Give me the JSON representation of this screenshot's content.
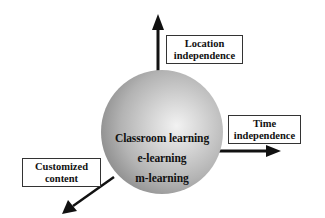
{
  "diagram": {
    "center": {
      "labels": [
        "Classroom learning",
        "e-learning",
        "m-learning"
      ],
      "shape": "sphere",
      "fill_gradient": [
        "#f2f2f2",
        "#b3b3b3",
        "#6e6e6e"
      ]
    },
    "axes": [
      {
        "direction": "up",
        "label_line1": "Location",
        "label_line2": "independence"
      },
      {
        "direction": "right",
        "label_line1": "Time",
        "label_line2": "independence"
      },
      {
        "direction": "down-left",
        "label_line1": "Customized",
        "label_line2": "content"
      }
    ],
    "colors": {
      "arrow": "#111111",
      "box_border": "#333333",
      "text": "#111111",
      "background": "#ffffff"
    }
  }
}
